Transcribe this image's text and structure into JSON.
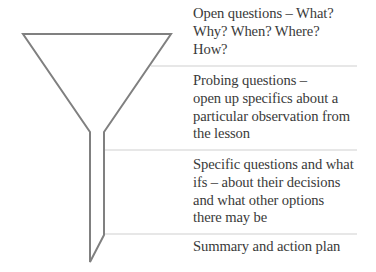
{
  "diagram": {
    "type": "funnel",
    "stroke_color": "#808080",
    "divider_color": "#c8c8c8",
    "text_color": "#3a3a3a",
    "stages": [
      {
        "lines": [
          "Open questions – What?",
          "Why? When? Where?",
          "How?"
        ]
      },
      {
        "lines": [
          "Probing questions –",
          "open up specifics about a",
          "particular observation from",
          "the lesson"
        ]
      },
      {
        "lines": [
          "Specific questions and what",
          "ifs – about their decisions",
          "and what other options",
          "there may be"
        ]
      },
      {
        "lines": [
          "Summary and action plan"
        ]
      }
    ]
  }
}
